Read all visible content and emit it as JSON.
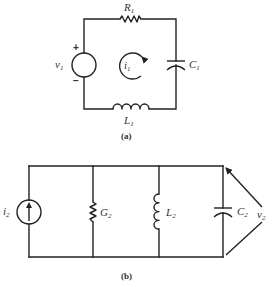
{
  "figure_a": {
    "caption": "(a)",
    "topology": "series RLC loop",
    "source": {
      "type": "voltage-source",
      "symbol": "v",
      "subscript": "1",
      "plus": "+",
      "minus": "−"
    },
    "resistor": {
      "symbol": "R",
      "subscript": "1"
    },
    "capacitor": {
      "symbol": "C",
      "subscript": "1"
    },
    "inductor": {
      "symbol": "L",
      "subscript": "1"
    },
    "loop_current": {
      "symbol": "i",
      "subscript": "1",
      "direction": "clockwise"
    }
  },
  "figure_b": {
    "caption": "(b)",
    "topology": "parallel GLC network",
    "source": {
      "type": "current-source",
      "symbol": "i",
      "subscript": "2",
      "direction": "up"
    },
    "conductance": {
      "symbol": "G",
      "subscript": "2"
    },
    "inductor": {
      "symbol": "L",
      "subscript": "2"
    },
    "capacitor": {
      "symbol": "C",
      "subscript": "2"
    },
    "voltage": {
      "symbol": "v",
      "subscript": "2"
    }
  },
  "colors": {
    "line": "#222222",
    "text": "#333333",
    "background": "#ffffff"
  }
}
